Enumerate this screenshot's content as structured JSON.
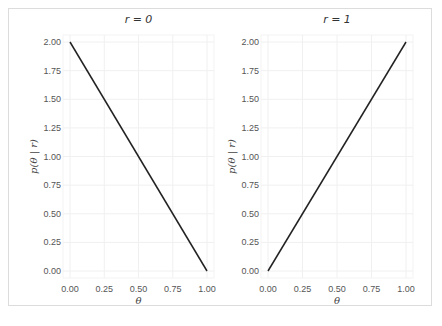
{
  "chart_data": [
    {
      "type": "line",
      "title": "r = 0",
      "xlabel": "θ",
      "ylabel": "p(θ | r)",
      "x": [
        0.0,
        1.0
      ],
      "series": [
        {
          "name": "p(θ | r=0)",
          "values": [
            2.0,
            0.0
          ],
          "color": "#222222"
        }
      ],
      "xticks": [
        "0.00",
        "0.25",
        "0.50",
        "0.75",
        "1.00"
      ],
      "yticks": [
        "0.00",
        "0.25",
        "0.50",
        "0.75",
        "1.00",
        "1.25",
        "1.50",
        "1.75",
        "2.00"
      ],
      "xlim": [
        0,
        1
      ],
      "ylim": [
        0,
        2
      ],
      "grid": true
    },
    {
      "type": "line",
      "title": "r = 1",
      "xlabel": "θ",
      "ylabel": "p(θ | r)",
      "x": [
        0.0,
        1.0
      ],
      "series": [
        {
          "name": "p(θ | r=1)",
          "values": [
            0.0,
            2.0
          ],
          "color": "#222222"
        }
      ],
      "xticks": [
        "0.00",
        "0.25",
        "0.50",
        "0.75",
        "1.00"
      ],
      "yticks": [
        "0.00",
        "0.25",
        "0.50",
        "0.75",
        "1.00",
        "1.25",
        "1.50",
        "1.75",
        "2.00"
      ],
      "xlim": [
        0,
        1
      ],
      "ylim": [
        0,
        2
      ],
      "grid": true
    }
  ],
  "panels": [
    {
      "title": "r = 0",
      "xlabel": "θ",
      "ylabel": "p(θ | r)"
    },
    {
      "title": "r = 1",
      "xlabel": "θ",
      "ylabel": "p(θ | r)"
    }
  ]
}
